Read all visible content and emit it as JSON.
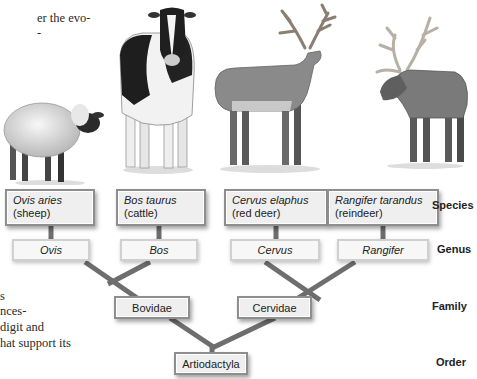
{
  "text_fragments": [
    {
      "text": "er the evo-",
      "x": 37,
      "y": 11
    },
    {
      "text": "",
      "x": 37,
      "y": 26
    },
    {
      "text": "s",
      "x": 0,
      "y": 289
    },
    {
      "text": "nces-",
      "x": 0,
      "y": 304
    },
    {
      "text": " digit and",
      "x": 0,
      "y": 320
    },
    {
      "text": "hat support its",
      "x": 0,
      "y": 336
    }
  ],
  "animals": [
    {
      "name": "sheep"
    },
    {
      "name": "cow"
    },
    {
      "name": "red-deer"
    },
    {
      "name": "reindeer"
    }
  ],
  "species": [
    {
      "scientific": "Ovis aries",
      "common": "(sheep)"
    },
    {
      "scientific": "Bos taurus",
      "common": "(cattle)"
    },
    {
      "scientific": "Cervus elaphus",
      "common": "(red deer)"
    },
    {
      "scientific": "Rangifer tarandus",
      "common": "(reindeer)"
    }
  ],
  "genus": [
    "Ovis",
    "Bos",
    "Cervus",
    "Rangifer"
  ],
  "family": [
    "Bovidae",
    "Cervidae"
  ],
  "order": [
    "Artiodactyla"
  ],
  "ranks": {
    "species": "Species",
    "genus": "Genus",
    "family": "Family",
    "order": "Order"
  },
  "colors": {
    "branch": "#6e6e6e",
    "box_border": "#8e8e8e",
    "box_fill": "#efefef"
  }
}
